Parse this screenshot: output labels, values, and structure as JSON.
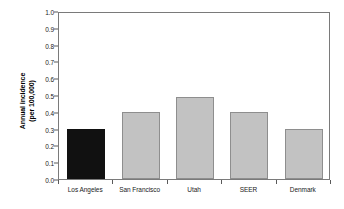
{
  "chart_data": {
    "type": "bar",
    "title": "",
    "xlabel": "",
    "ylabel": "Annual incidence (per 100,000)",
    "ylabel_line1": "Annual incidence",
    "ylabel_line2": "(per 100,000)",
    "categories": [
      "Los Angeles",
      "San Francisco",
      "Utah",
      "SEER",
      "Denmark"
    ],
    "values": [
      0.3,
      0.4,
      0.49,
      0.4,
      0.3
    ],
    "ylim": [
      0.0,
      1.0
    ],
    "ytick_labels": [
      "1.0",
      "0.9",
      "0.8",
      "0.7",
      "0.6",
      "0.5",
      "0.4",
      "0.3",
      "0.2",
      "0.1",
      "0.0"
    ],
    "ytick_values": [
      1.0,
      0.9,
      0.8,
      0.7,
      0.6,
      0.5,
      0.4,
      0.3,
      0.2,
      0.1,
      0.0
    ],
    "grid": false,
    "legend": "none",
    "bar_colors": [
      "#111111",
      "#c2c2c2",
      "#c2c2c2",
      "#c2c2c2",
      "#c2c2c2"
    ],
    "bar_border_colors": [
      "#111111",
      "#8e8e8e",
      "#8e8e8e",
      "#8e8e8e",
      "#8e8e8e"
    ],
    "highlight_category": "Los Angeles",
    "frame_color": "#7a7a7a",
    "background": "#ffffff"
  }
}
